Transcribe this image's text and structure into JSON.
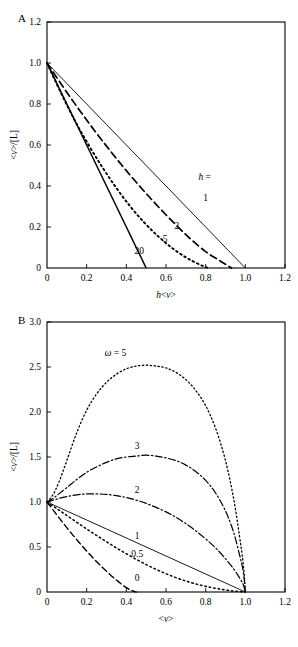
{
  "figure": {
    "background": "#ffffff",
    "ink": "#000000",
    "panels": [
      "A",
      "B"
    ]
  },
  "chart_data": [
    {
      "id": "panel-a",
      "panel_letter": "A",
      "type": "line",
      "title": "",
      "xlabel": "h<v>",
      "ylabel": "<v>/[L]",
      "xlim": [
        0,
        1.2
      ],
      "ylim": [
        0,
        1.2
      ],
      "xticks": [
        0,
        0.2,
        0.4,
        0.6,
        0.8,
        1.0,
        1.2
      ],
      "xticklabels": [
        "0",
        "0.2",
        "0.4",
        "0.6",
        "0.8",
        "1.0",
        "1.2"
      ],
      "yticks": [
        0,
        0.2,
        0.4,
        0.6,
        0.8,
        1.0,
        1.2
      ],
      "yticklabels": [
        "0",
        "0.2",
        "0.4",
        "0.6",
        "0.8",
        "1.0",
        "1.2"
      ],
      "grid": false,
      "legend_position": "inline-annotations",
      "legend_prefix": "h =",
      "series": [
        {
          "name": "1",
          "label": "1",
          "style": "solid",
          "width": 0.9,
          "dash": "",
          "label_x": 0.8,
          "label_y": 0.345,
          "x": [
            0.0,
            0.1,
            0.2,
            0.3,
            0.4,
            0.5,
            0.6,
            0.7,
            0.8,
            0.9,
            1.0
          ],
          "y": [
            1.0,
            0.9,
            0.8,
            0.7,
            0.6,
            0.5,
            0.4,
            0.3,
            0.2,
            0.1,
            0.0
          ]
        },
        {
          "name": "2",
          "label": "2",
          "style": "dashed",
          "width": 1.7,
          "dash": "7,4",
          "label_x": 0.655,
          "label_y": 0.205,
          "x": [
            0.0,
            0.08,
            0.16,
            0.24,
            0.32,
            0.4,
            0.48,
            0.56,
            0.64,
            0.72,
            0.8,
            0.86,
            0.9,
            0.93
          ],
          "y": [
            1.0,
            0.885,
            0.775,
            0.67,
            0.57,
            0.475,
            0.385,
            0.3,
            0.22,
            0.145,
            0.08,
            0.042,
            0.018,
            0.0
          ]
        },
        {
          "name": "5",
          "label": "5",
          "style": "dotted",
          "width": 1.9,
          "dash": "1.6,3.2",
          "label_x": 0.595,
          "label_y": 0.145,
          "x": [
            0.0,
            0.07,
            0.14,
            0.21,
            0.28,
            0.35,
            0.42,
            0.49,
            0.56,
            0.63,
            0.7,
            0.75,
            0.79,
            0.815
          ],
          "y": [
            1.0,
            0.855,
            0.72,
            0.6,
            0.49,
            0.39,
            0.3,
            0.222,
            0.155,
            0.098,
            0.052,
            0.026,
            0.008,
            0.0
          ]
        },
        {
          "name": "20",
          "label": "20",
          "style": "solid",
          "width": 1.5,
          "dash": "",
          "label_x": 0.465,
          "label_y": 0.085,
          "x": [
            0.0,
            0.05,
            0.1,
            0.15,
            0.2,
            0.25,
            0.3,
            0.35,
            0.4,
            0.45,
            0.48,
            0.5
          ],
          "y": [
            1.0,
            0.9,
            0.8,
            0.7,
            0.6,
            0.5,
            0.4,
            0.3,
            0.2,
            0.1,
            0.04,
            0.0
          ]
        }
      ]
    },
    {
      "id": "panel-b",
      "panel_letter": "B",
      "type": "line",
      "title": "",
      "xlabel": "<v>",
      "ylabel": "<v>/[L]",
      "xlim": [
        0,
        1.2
      ],
      "ylim": [
        0,
        3.0
      ],
      "xticks": [
        0,
        0.2,
        0.4,
        0.6,
        0.8,
        1.0,
        1.2
      ],
      "xticklabels": [
        "0",
        "0.2",
        "0.4",
        "0.6",
        "0.8",
        "1.0",
        "1.2"
      ],
      "yticks": [
        0,
        0.5,
        1.0,
        1.5,
        2.0,
        2.5,
        3.0
      ],
      "yticklabels": [
        "0",
        "0.5",
        "1.0",
        "1.5",
        "2.0",
        "2.5",
        "3.0"
      ],
      "grid": false,
      "legend_position": "inline-annotations",
      "legend_prefix": "ω = 5",
      "series": [
        {
          "name": "5",
          "label": "ω = 5",
          "style": "dotted",
          "width": 1.3,
          "dash": "1.3,2.6",
          "label_x": 0.345,
          "label_y": 2.66,
          "x": [
            0.0,
            0.03,
            0.06,
            0.1,
            0.15,
            0.2,
            0.25,
            0.3,
            0.35,
            0.4,
            0.45,
            0.5,
            0.55,
            0.6,
            0.65,
            0.7,
            0.75,
            0.8,
            0.85,
            0.9,
            0.94,
            0.97,
            0.99,
            1.0
          ],
          "y": [
            1.0,
            1.08,
            1.22,
            1.46,
            1.77,
            2.02,
            2.2,
            2.33,
            2.42,
            2.48,
            2.51,
            2.52,
            2.51,
            2.49,
            2.44,
            2.36,
            2.24,
            2.07,
            1.82,
            1.46,
            1.05,
            0.63,
            0.3,
            0.0
          ]
        },
        {
          "name": "3",
          "label": "3",
          "style": "dashdot",
          "width": 1.2,
          "dash": "7,2.5,1.5,2.5",
          "label_x": 0.455,
          "label_y": 1.63,
          "x": [
            0.0,
            0.03,
            0.06,
            0.1,
            0.15,
            0.2,
            0.25,
            0.3,
            0.35,
            0.4,
            0.45,
            0.5,
            0.55,
            0.6,
            0.65,
            0.7,
            0.75,
            0.8,
            0.85,
            0.9,
            0.94,
            0.97,
            0.99,
            1.0
          ],
          "y": [
            1.0,
            1.04,
            1.09,
            1.16,
            1.25,
            1.33,
            1.39,
            1.44,
            1.48,
            1.5,
            1.51,
            1.52,
            1.51,
            1.49,
            1.46,
            1.41,
            1.34,
            1.24,
            1.1,
            0.9,
            0.67,
            0.42,
            0.22,
            0.0
          ]
        },
        {
          "name": "2",
          "label": "2",
          "style": "dashdot",
          "width": 1.2,
          "dash": "7,2.5,1.5,2.5",
          "label_x": 0.455,
          "label_y": 1.14,
          "x": [
            0.0,
            0.03,
            0.06,
            0.1,
            0.15,
            0.2,
            0.25,
            0.3,
            0.35,
            0.4,
            0.45,
            0.5,
            0.55,
            0.6,
            0.65,
            0.7,
            0.75,
            0.8,
            0.85,
            0.9,
            0.94,
            0.97,
            0.99,
            1.0
          ],
          "y": [
            1.0,
            1.02,
            1.04,
            1.06,
            1.08,
            1.09,
            1.09,
            1.085,
            1.07,
            1.05,
            1.02,
            0.985,
            0.94,
            0.89,
            0.83,
            0.76,
            0.68,
            0.59,
            0.49,
            0.37,
            0.26,
            0.16,
            0.08,
            0.0
          ]
        },
        {
          "name": "1",
          "label": "1",
          "style": "solid",
          "width": 0.9,
          "dash": "",
          "label_x": 0.455,
          "label_y": 0.63,
          "x": [
            0.0,
            0.1,
            0.2,
            0.3,
            0.4,
            0.5,
            0.6,
            0.7,
            0.8,
            0.9,
            1.0
          ],
          "y": [
            1.0,
            0.9,
            0.8,
            0.7,
            0.6,
            0.5,
            0.4,
            0.3,
            0.2,
            0.1,
            0.0
          ]
        },
        {
          "name": "0.5",
          "label": "0.5",
          "style": "dotted",
          "width": 1.5,
          "dash": "1.5,3.0",
          "label_x": 0.455,
          "label_y": 0.43,
          "x": [
            0.0,
            0.05,
            0.1,
            0.15,
            0.2,
            0.25,
            0.3,
            0.35,
            0.4,
            0.45,
            0.5,
            0.55,
            0.6,
            0.65,
            0.7,
            0.75,
            0.8,
            0.85,
            0.9,
            0.95,
            1.0
          ],
          "y": [
            1.0,
            0.925,
            0.85,
            0.775,
            0.7,
            0.628,
            0.558,
            0.49,
            0.425,
            0.363,
            0.305,
            0.252,
            0.203,
            0.16,
            0.122,
            0.09,
            0.063,
            0.041,
            0.023,
            0.009,
            0.0
          ]
        },
        {
          "name": "0",
          "label": "0",
          "style": "dashed",
          "width": 1.4,
          "dash": "6,3.5",
          "label_x": 0.455,
          "label_y": 0.155,
          "x": [
            0.0,
            0.04,
            0.08,
            0.12,
            0.16,
            0.2,
            0.24,
            0.28,
            0.32,
            0.36,
            0.4,
            0.43,
            0.45
          ],
          "y": [
            1.0,
            0.885,
            0.77,
            0.66,
            0.555,
            0.455,
            0.36,
            0.272,
            0.19,
            0.115,
            0.048,
            0.014,
            0.0
          ]
        }
      ]
    }
  ]
}
